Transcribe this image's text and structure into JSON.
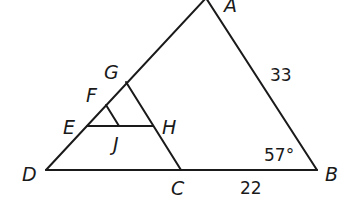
{
  "diagram": {
    "title": "",
    "points": {
      "A": {
        "label": "A",
        "x": 206,
        "y": 0
      },
      "B": {
        "label": "B",
        "x": 317,
        "y": 170
      },
      "C": {
        "label": "C",
        "x": 181,
        "y": 170
      },
      "D": {
        "label": "D",
        "x": 46,
        "y": 170
      },
      "E": {
        "label": "E",
        "x": 87,
        "y": 126
      },
      "F": {
        "label": "F",
        "x": 106,
        "y": 105
      },
      "G": {
        "label": "G",
        "x": 126,
        "y": 82
      },
      "H": {
        "label": "H",
        "x": 153,
        "y": 126
      },
      "J": {
        "label": "J",
        "x": 119,
        "y": 126
      }
    },
    "segments": [
      {
        "from": "D",
        "to": "A"
      },
      {
        "from": "A",
        "to": "B"
      },
      {
        "from": "D",
        "to": "B"
      },
      {
        "from": "G",
        "to": "C"
      },
      {
        "from": "E",
        "to": "H"
      },
      {
        "from": "F",
        "to": "J"
      }
    ],
    "measurements": {
      "AB": "33",
      "CB": "22",
      "angle_B": "57°"
    },
    "stroke_color": "#1a1a1a",
    "background": "#ffffff"
  }
}
